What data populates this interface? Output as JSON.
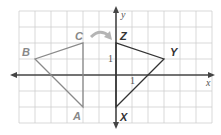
{
  "diagram": {
    "type": "coordinate-plane-rotation",
    "axes": {
      "x_label": "x",
      "y_label": "y",
      "tick_label_x": "1",
      "tick_label_y": "1"
    },
    "colors": {
      "grid": "#c8c8c8",
      "axis": "#444444",
      "preimage": "#888888",
      "image": "#333333",
      "preimage_label": "#888888",
      "image_label": "#333333",
      "arrow": "#b0b0b0"
    },
    "preimage": {
      "name": "triangle ABC",
      "vertices": [
        {
          "label": "A",
          "x": -2,
          "y": -2
        },
        {
          "label": "B",
          "x": -5,
          "y": 1
        },
        {
          "label": "C",
          "x": -2,
          "y": 2
        }
      ]
    },
    "image": {
      "name": "triangle XYZ",
      "vertices": [
        {
          "label": "X",
          "x": 0,
          "y": -2
        },
        {
          "label": "Y",
          "x": 3,
          "y": 1
        },
        {
          "label": "Z",
          "x": 0,
          "y": 2
        }
      ]
    },
    "transformation_arrow": "curved arrow from C to Z"
  }
}
